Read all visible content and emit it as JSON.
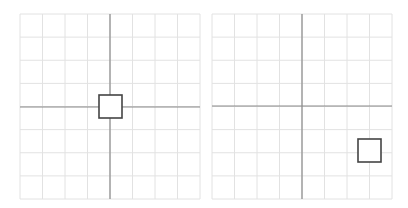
{
  "figure": {
    "colors": {
      "background": "#ffffff",
      "grid_line": "#e2e2e2",
      "axis_line": "#8a8a8a",
      "square_stroke": "#444444",
      "square_fill": "#ffffff"
    },
    "panels": [
      {
        "name": "original",
        "grid": {
          "cells_x": 8,
          "cells_y": 8,
          "left": 20,
          "top": 14,
          "width": 180,
          "height": 185
        },
        "axes": {
          "x_axis_y": 107,
          "y_axis_x": 110
        },
        "square": {
          "x": 99,
          "y": 95,
          "size": 23
        }
      },
      {
        "name": "translated",
        "grid": {
          "cells_x": 8,
          "cells_y": 8,
          "left": 8,
          "top": 14,
          "width": 180,
          "height": 185
        },
        "axes": {
          "x_axis_y": 106,
          "y_axis_x": 98
        },
        "square": {
          "x": 154,
          "y": 139,
          "size": 23
        }
      }
    ]
  }
}
